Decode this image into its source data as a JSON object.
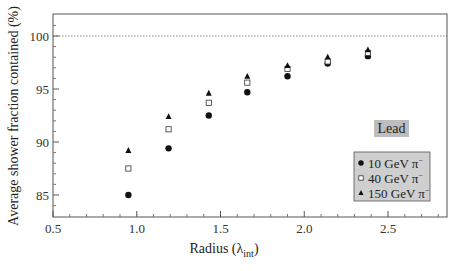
{
  "chart_data": {
    "type": "scatter",
    "title": "",
    "xlabel": "Radius (λ_int)",
    "xlabel_main": "Radius (",
    "xlabel_lambda": "λ",
    "xlabel_sub": "int",
    "xlabel_close": ")",
    "ylabel": "Average shower fraction contained (%)",
    "xlim": [
      0.5,
      2.85
    ],
    "ylim": [
      83.2,
      102.0
    ],
    "xticks": [
      0.5,
      1.0,
      1.5,
      2.0,
      2.5
    ],
    "xtick_labels": [
      "0.5",
      "1.0",
      "1.5",
      "2.0",
      "2.5"
    ],
    "yticks": [
      85,
      90,
      95,
      100
    ],
    "ytick_labels": [
      "85",
      "90",
      "95",
      "100"
    ],
    "reference_line": {
      "y": 100,
      "style": "dotted"
    },
    "annotation": "Lead",
    "legend_position": "lower right",
    "x": [
      0.95,
      1.19,
      1.43,
      1.66,
      1.9,
      2.14,
      2.38
    ],
    "series": [
      {
        "name": "10 GeV π⁻",
        "label_text": "10 GeV",
        "particle": "π",
        "marker": "circle-filled",
        "values": [
          85.0,
          89.4,
          92.5,
          94.7,
          96.2,
          97.4,
          98.1
        ]
      },
      {
        "name": "40 GeV π⁻",
        "label_text": "40 GeV",
        "particle": "π",
        "marker": "square-open",
        "values": [
          87.5,
          91.2,
          93.7,
          95.6,
          96.9,
          97.6,
          98.4
        ]
      },
      {
        "name": "150 GeV π⁻",
        "label_text": "150 GeV",
        "particle": "π",
        "marker": "triangle-filled",
        "values": [
          89.2,
          92.4,
          94.6,
          96.2,
          97.2,
          98.0,
          98.7
        ]
      }
    ]
  },
  "colors": {
    "axis": "#555555",
    "marker": "#111111",
    "legend_bg": "#cfcfcf",
    "annotation_bg": "#bdbdbd",
    "refline": "#888888"
  }
}
